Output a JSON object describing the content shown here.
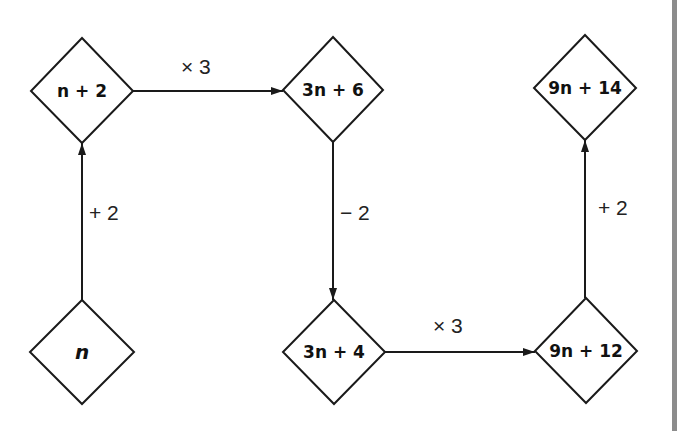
{
  "diagram": {
    "type": "flowchart",
    "nodes": [
      {
        "id": "n",
        "label": "n",
        "cx": 82,
        "cy": 352
      },
      {
        "id": "n_plus_2",
        "label": "n + 2",
        "cx": 82,
        "cy": 91
      },
      {
        "id": "3n_plus_6",
        "label": "3n + 6",
        "cx": 333,
        "cy": 90
      },
      {
        "id": "3n_plus_4",
        "label": "3n + 4",
        "cx": 334,
        "cy": 352
      },
      {
        "id": "9n_plus_12",
        "label": "9n + 12",
        "cx": 586,
        "cy": 351
      },
      {
        "id": "9n_plus_14",
        "label": "9n + 14",
        "cx": 585,
        "cy": 88
      }
    ],
    "edges": [
      {
        "from": "n",
        "to": "n_plus_2",
        "label": "+ 2"
      },
      {
        "from": "n_plus_2",
        "to": "3n_plus_6",
        "label": "× 3"
      },
      {
        "from": "3n_plus_6",
        "to": "3n_plus_4",
        "label": "− 2"
      },
      {
        "from": "3n_plus_4",
        "to": "9n_plus_12",
        "label": "× 3"
      },
      {
        "from": "9n_plus_12",
        "to": "9n_plus_14",
        "label": "+ 2"
      }
    ],
    "colors": {
      "stroke": "#1a1a1a",
      "side_bar": "#8c8c8c",
      "background": "#ffffff"
    }
  }
}
